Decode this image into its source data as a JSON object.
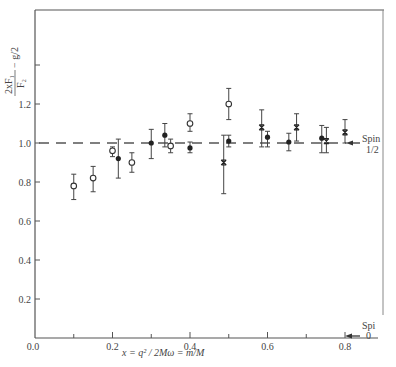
{
  "chart_data": {
    "type": "scatter",
    "title": "",
    "xlabel": "x = q^2 / 2Mω = m/M",
    "ylabel": "2xF1/F2 − g/2",
    "xlim": [
      0.0,
      0.87
    ],
    "ylim": [
      0.0,
      1.68
    ],
    "x_ticks": [
      "0.0",
      "0.2",
      "0.4",
      "0.6",
      "0.8"
    ],
    "x_minor_ticks": [
      0.1,
      0.3,
      0.5,
      0.7
    ],
    "y_ticks": [
      "0.2",
      "0.4",
      "0.6",
      "0.8",
      "1.0",
      "1.2"
    ],
    "y_tick_values": [
      0.2,
      0.4,
      0.6,
      0.8,
      1.0,
      1.2,
      1.4
    ],
    "grid": false,
    "reference_lines": [
      {
        "name": "Spin 1/2",
        "y": 1.0,
        "style": "dashed",
        "label": "Spin 1/2"
      },
      {
        "name": "Spin 0",
        "y": 0.0,
        "style": "solid",
        "label": "Spin 0"
      }
    ],
    "series": [
      {
        "name": "open circles",
        "marker": "open-circle",
        "points": [
          {
            "x": 0.1,
            "y": 0.78,
            "ylo": 0.71,
            "yhi": 0.84
          },
          {
            "x": 0.15,
            "y": 0.82,
            "ylo": 0.75,
            "yhi": 0.88
          },
          {
            "x": 0.2,
            "y": 0.96,
            "ylo": 0.93,
            "yhi": 0.98
          },
          {
            "x": 0.25,
            "y": 0.9,
            "ylo": 0.85,
            "yhi": 0.95
          },
          {
            "x": 0.35,
            "y": 0.985,
            "ylo": 0.95,
            "yhi": 1.02
          },
          {
            "x": 0.4,
            "y": 1.1,
            "ylo": 1.06,
            "yhi": 1.15
          },
          {
            "x": 0.5,
            "y": 1.2,
            "ylo": 1.12,
            "yhi": 1.28
          }
        ]
      },
      {
        "name": "filled circles",
        "marker": "filled-circle",
        "points": [
          {
            "x": 0.215,
            "y": 0.92,
            "ylo": 0.82,
            "yhi": 1.02
          },
          {
            "x": 0.3,
            "y": 1.0,
            "ylo": 0.92,
            "yhi": 1.07
          },
          {
            "x": 0.335,
            "y": 1.04,
            "ylo": 0.98,
            "yhi": 1.1
          },
          {
            "x": 0.4,
            "y": 0.975,
            "ylo": 0.95,
            "yhi": 1.005
          },
          {
            "x": 0.5,
            "y": 1.01,
            "ylo": 0.98,
            "yhi": 1.04
          },
          {
            "x": 0.6,
            "y": 1.03,
            "ylo": 0.98,
            "yhi": 1.06
          },
          {
            "x": 0.655,
            "y": 1.005,
            "ylo": 0.96,
            "yhi": 1.05
          },
          {
            "x": 0.74,
            "y": 1.025,
            "ylo": 0.95,
            "yhi": 1.09
          }
        ]
      },
      {
        "name": "crosses",
        "marker": "cross",
        "points": [
          {
            "x": 0.487,
            "y": 0.9,
            "ylo": 0.74,
            "yhi": 1.04
          },
          {
            "x": 0.585,
            "y": 1.08,
            "ylo": 0.98,
            "yhi": 1.17
          },
          {
            "x": 0.675,
            "y": 1.08,
            "ylo": 1.01,
            "yhi": 1.15
          },
          {
            "x": 0.752,
            "y": 1.01,
            "ylo": 0.95,
            "yhi": 1.08
          },
          {
            "x": 0.8,
            "y": 1.055,
            "ylo": 1.0,
            "yhi": 1.12
          }
        ]
      }
    ]
  },
  "labels": {
    "spin_half_line1": "Spin",
    "spin_half_line2": "1/2",
    "spin_zero_line1": "Spi",
    "spin_zero_line2": "0",
    "x_axis_title": "x = q² / 2Mω = m/M",
    "y_axis_title_main": "2xF₁",
    "y_axis_title_denom": "F₂",
    "y_axis_title_tail": "− g/2"
  }
}
